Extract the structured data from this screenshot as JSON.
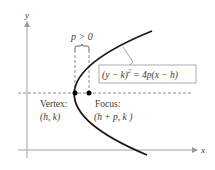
{
  "axes": {
    "x_label": "x",
    "y_label": "y",
    "axis_color": "#9a9a9a"
  },
  "parabola": {
    "color": "#1a1a1a",
    "orientation": "opens right"
  },
  "brace_label": "p > 0",
  "equation": {
    "lhs": "(y − k)",
    "exponent": "2",
    "rhs": " = 4p(x − h)"
  },
  "vertex": {
    "title": "Vertex:",
    "coords": "(h, k)"
  },
  "focus": {
    "title": "Focus:",
    "coords": "(h + p, k )"
  },
  "colors": {
    "dashed_line": "#7a7a7a",
    "box_border": "#9a9a9a",
    "point": "#000000"
  }
}
